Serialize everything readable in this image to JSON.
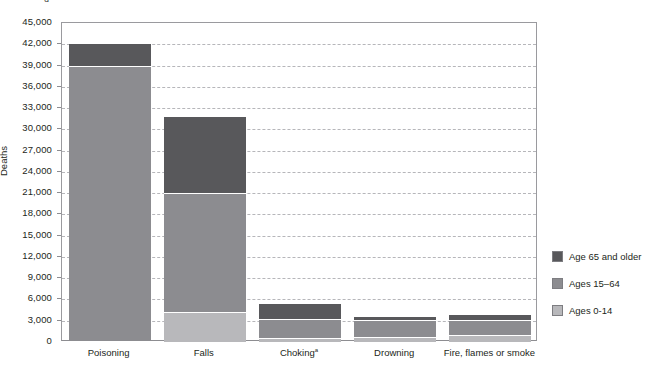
{
  "top_fragment": {
    "left_text": "u",
    "right_text": "··"
  },
  "chart_data": {
    "type": "bar",
    "subtype": "stacked",
    "title": "",
    "xlabel": "",
    "ylabel": "Deaths",
    "ylim": [
      0,
      45000
    ],
    "ytick_step": 3000,
    "grid": true,
    "legend_position": "right",
    "categories": [
      "Poisoning",
      "Falls",
      "Choking",
      "Drowning",
      "Fire, flames or smoke"
    ],
    "category_footnotes": [
      "",
      "",
      "a",
      "",
      ""
    ],
    "ytick_labels": [
      "45,000",
      "42,000",
      "39,000",
      "36,000",
      "33,000",
      "30,000",
      "27,000",
      "24,000",
      "21,000",
      "18,000",
      "15,000",
      "12,000",
      "9,000",
      "6,000",
      "3,000",
      "0"
    ],
    "series": [
      {
        "name": "Age 65 and older",
        "color": "#58585b",
        "values": [
          3100,
          10700,
          2150,
          400,
          700
        ]
      },
      {
        "name": "Ages 15-64",
        "color": "#8c8c90",
        "values": [
          38700,
          16800,
          2650,
          2350,
          2150
        ]
      },
      {
        "name": "Ages 0-14",
        "color": "#b8b8bb",
        "values": [
          200,
          4200,
          550,
          750,
          950
        ]
      }
    ],
    "totals": [
      42000,
      31700,
      5350,
      3500,
      3800
    ]
  },
  "legend": {
    "items": [
      {
        "label": "Age 65 and older",
        "color": "#58585b"
      },
      {
        "label": "Ages 15–64",
        "color": "#8c8c90"
      },
      {
        "label": "Ages 0-14",
        "color": "#b8b8bb"
      }
    ]
  }
}
